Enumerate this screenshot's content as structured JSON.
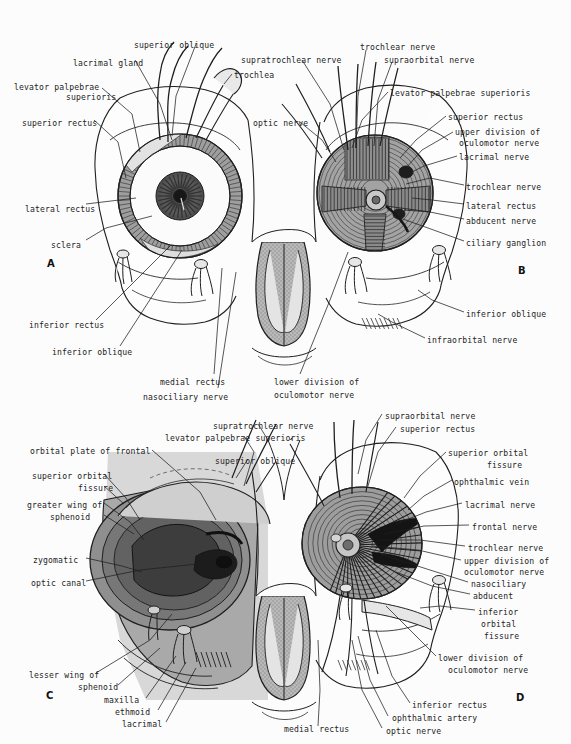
{
  "figure": {
    "background_color": "#fcfcfc",
    "ink_color": "#1c1c1c",
    "tones": {
      "bone_light": "#d9d9d9",
      "bone_mid": "#b3b3b3",
      "bone_dark": "#8a8a8a",
      "muscle": "#9a9a9a",
      "deep_shadow": "#3a3a3a",
      "sclera_white": "#fbfbfb",
      "iris": "#555555"
    },
    "panels": [
      {
        "id": "A",
        "letter": "A",
        "x": 47,
        "y": 258,
        "caption": "anterior view of orbit with eyeball in situ"
      },
      {
        "id": "B",
        "letter": "B",
        "x": 518,
        "y": 265,
        "caption": "orbit with eyeball removed showing muscle cone"
      },
      {
        "id": "C",
        "letter": "C",
        "x": 46,
        "y": 690,
        "caption": "bony orbit with periorbita"
      },
      {
        "id": "D",
        "letter": "D",
        "x": 516,
        "y": 692,
        "caption": "deep dissection of orbital apex"
      }
    ]
  },
  "labels_A": [
    {
      "text": "superior oblique",
      "x": 134,
      "y": 40,
      "align": "left"
    },
    {
      "text": "lacrimal gland",
      "x": 73,
      "y": 58,
      "align": "left"
    },
    {
      "text": "trochlea",
      "x": 234,
      "y": 70,
      "align": "left"
    },
    {
      "text": "levator palpebrae",
      "x": 14,
      "y": 82,
      "align": "left"
    },
    {
      "text": "superioris",
      "x": 66,
      "y": 92,
      "align": "left"
    },
    {
      "text": "superior rectus",
      "x": 22,
      "y": 118,
      "align": "left"
    },
    {
      "text": "lateral rectus",
      "x": 25,
      "y": 204,
      "align": "left"
    },
    {
      "text": "sclera",
      "x": 51,
      "y": 240,
      "align": "left"
    },
    {
      "text": "inferior rectus",
      "x": 29,
      "y": 320,
      "align": "left"
    },
    {
      "text": "inferior oblique",
      "x": 52,
      "y": 347,
      "align": "left"
    },
    {
      "text": "medial rectus",
      "x": 160,
      "y": 377,
      "align": "left"
    },
    {
      "text": "nasociliary nerve",
      "x": 143,
      "y": 392,
      "align": "left"
    }
  ],
  "labels_B": [
    {
      "text": "supratrochlear nerve",
      "x": 241,
      "y": 55,
      "align": "left"
    },
    {
      "text": "trochlear nerve",
      "x": 360,
      "y": 42,
      "align": "left"
    },
    {
      "text": "supraorbital nerve",
      "x": 384,
      "y": 55,
      "align": "left"
    },
    {
      "text": "optic nerve",
      "x": 253,
      "y": 118,
      "align": "left"
    },
    {
      "text": "levator palpebrae superioris",
      "x": 390,
      "y": 88,
      "align": "left"
    },
    {
      "text": "superior rectus",
      "x": 448,
      "y": 112,
      "align": "left"
    },
    {
      "text": "upper division of",
      "x": 455,
      "y": 127,
      "align": "left"
    },
    {
      "text": "oculomotor nerve",
      "x": 459,
      "y": 138,
      "align": "left"
    },
    {
      "text": "lacrimal nerve",
      "x": 459,
      "y": 152,
      "align": "left"
    },
    {
      "text": "trochlear nerve",
      "x": 466,
      "y": 182,
      "align": "left"
    },
    {
      "text": "lateral rectus",
      "x": 466,
      "y": 201,
      "align": "left"
    },
    {
      "text": "abducent nerve",
      "x": 466,
      "y": 216,
      "align": "left"
    },
    {
      "text": "ciliary ganglion",
      "x": 466,
      "y": 238,
      "align": "left"
    },
    {
      "text": "inferior oblique",
      "x": 466,
      "y": 309,
      "align": "left"
    },
    {
      "text": "infraorbital nerve",
      "x": 427,
      "y": 335,
      "align": "left"
    },
    {
      "text": "lower division of",
      "x": 274,
      "y": 377,
      "align": "left"
    },
    {
      "text": "oculomotor nerve",
      "x": 274,
      "y": 390,
      "align": "left"
    }
  ],
  "labels_C": [
    {
      "text": "supratrochlear nerve",
      "x": 213,
      "y": 421,
      "align": "left"
    },
    {
      "text": "levator palpebrae superioris",
      "x": 165,
      "y": 433,
      "align": "left"
    },
    {
      "text": "superior oblique",
      "x": 215,
      "y": 456,
      "align": "left"
    },
    {
      "text": "orbital plate of frontal",
      "x": 30,
      "y": 446,
      "align": "left"
    },
    {
      "text": "superior orbital",
      "x": 32,
      "y": 471,
      "align": "left"
    },
    {
      "text": "fissure",
      "x": 78,
      "y": 483,
      "align": "left"
    },
    {
      "text": "greater wing of",
      "x": 27,
      "y": 500,
      "align": "left"
    },
    {
      "text": "sphenoid",
      "x": 50,
      "y": 512,
      "align": "left"
    },
    {
      "text": "zygomatic",
      "x": 33,
      "y": 555,
      "align": "left"
    },
    {
      "text": "optic canal",
      "x": 31,
      "y": 578,
      "align": "left"
    },
    {
      "text": "lesser wing of",
      "x": 29,
      "y": 670,
      "align": "left"
    },
    {
      "text": "sphenoid",
      "x": 78,
      "y": 682,
      "align": "left"
    },
    {
      "text": "maxilla",
      "x": 104,
      "y": 695,
      "align": "left"
    },
    {
      "text": "ethmoid",
      "x": 115,
      "y": 707,
      "align": "left"
    },
    {
      "text": "lacrimal",
      "x": 122,
      "y": 719,
      "align": "left"
    },
    {
      "text": "medial rectus",
      "x": 284,
      "y": 724,
      "align": "left"
    }
  ],
  "labels_D": [
    {
      "text": "supraorbital nerve",
      "x": 385,
      "y": 411,
      "align": "left"
    },
    {
      "text": "superior rectus",
      "x": 400,
      "y": 424,
      "align": "left"
    },
    {
      "text": "superior orbital",
      "x": 448,
      "y": 448,
      "align": "left"
    },
    {
      "text": "fissure",
      "x": 487,
      "y": 460,
      "align": "left"
    },
    {
      "text": "ophthalmic vein",
      "x": 454,
      "y": 477,
      "align": "left"
    },
    {
      "text": "lacrimal nerve",
      "x": 465,
      "y": 500,
      "align": "left"
    },
    {
      "text": "frontal nerve",
      "x": 472,
      "y": 522,
      "align": "left"
    },
    {
      "text": "trochlear nerve",
      "x": 468,
      "y": 543,
      "align": "left"
    },
    {
      "text": "upper division of",
      "x": 464,
      "y": 556,
      "align": "left"
    },
    {
      "text": "oculomotor nerve",
      "x": 464,
      "y": 567,
      "align": "left"
    },
    {
      "text": "nasociliary",
      "x": 471,
      "y": 579,
      "align": "left"
    },
    {
      "text": "abducent",
      "x": 473,
      "y": 591,
      "align": "left"
    },
    {
      "text": "inferior",
      "x": 478,
      "y": 607,
      "align": "left"
    },
    {
      "text": "orbital",
      "x": 481,
      "y": 619,
      "align": "left"
    },
    {
      "text": "fissure",
      "x": 484,
      "y": 631,
      "align": "left"
    },
    {
      "text": "lower division of",
      "x": 438,
      "y": 653,
      "align": "left"
    },
    {
      "text": "oculomotor nerve",
      "x": 448,
      "y": 665,
      "align": "left"
    },
    {
      "text": "inferior rectus",
      "x": 412,
      "y": 700,
      "align": "left"
    },
    {
      "text": "ophthalmic artery",
      "x": 392,
      "y": 713,
      "align": "left"
    },
    {
      "text": "optic nerve",
      "x": 386,
      "y": 726,
      "align": "left"
    }
  ]
}
